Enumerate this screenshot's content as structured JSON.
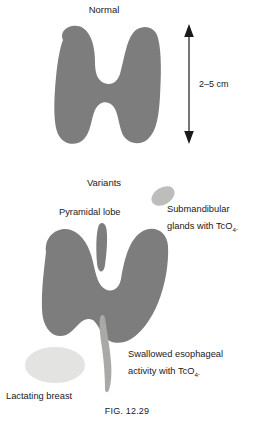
{
  "figure": {
    "caption": "FIG. 12.29",
    "panels": {
      "normal": {
        "title": "Normal",
        "dimension_label": "2–5 cm",
        "dimension_arrow": "double-headed-vertical-arrow"
      },
      "variants": {
        "title": "Variants",
        "annotations": {
          "pyramidal_lobe": "Pyramidal lobe",
          "submandibular_line1": "Submandibular",
          "submandibular_line2_prefix": "glands with TcO",
          "submandibular_sub": "4",
          "submandibular_sup": "-",
          "esophageal_line1": "Swallowed esophageal",
          "esophageal_line2_prefix": "activity with TcO",
          "esophageal_sub": "4",
          "esophageal_sup": "-",
          "lactating_breast": "Lactating breast"
        }
      }
    },
    "shapes": {
      "thyroid_normal": "thyroid-gland-normal-shape",
      "thyroid_variants": "thyroid-gland-variants-shape",
      "pyramidal_lobe": "pyramidal-lobe-shape",
      "submandibular_gland": "submandibular-gland-shape",
      "esophagus_streak": "swallowed-esophageal-activity-shape",
      "lactating_breast": "lactating-breast-shape"
    },
    "colors": {
      "gland_gray": "#7d7d7d",
      "light_gray": "#e3e3e1",
      "streak_gray": "#a9a9a7",
      "text": "#1a1a1a",
      "background": "#ffffff"
    }
  }
}
